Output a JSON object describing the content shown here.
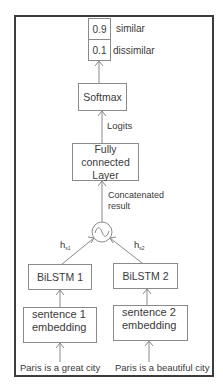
{
  "diagram": {
    "outputs": [
      {
        "value": "0.9",
        "label": "similar"
      },
      {
        "value": "0.1",
        "label": "dissimilar"
      }
    ],
    "nodes": {
      "softmax": "Softmax",
      "fully_connected": {
        "line1": "Fully connected",
        "line2": "Layer"
      },
      "concat_op": "~",
      "bilstm1": "BiLSTM 1",
      "bilstm2": "BiLSTM 2",
      "embedding1": {
        "line1": "sentence 1",
        "line2": "embedding"
      },
      "embedding2": {
        "line1": "sentence 2",
        "line2": "embedding"
      }
    },
    "edge_labels": {
      "logits": "Logits",
      "concatenated": {
        "line1": "Concatenated",
        "line2": "result"
      },
      "hs1": {
        "base": "h",
        "sub": "s1"
      },
      "hs2": {
        "base": "h",
        "sub": "s2"
      }
    },
    "inputs": {
      "sentence1": "Paris is a great city",
      "sentence2": "Paris is a beautiful city"
    }
  }
}
